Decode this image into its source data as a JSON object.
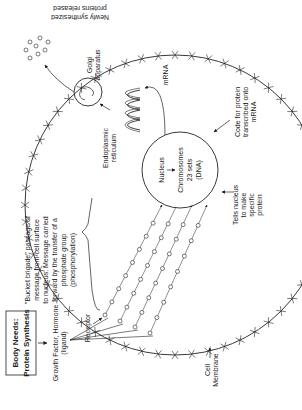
{
  "title_box": {
    "line1": "Body Needs:",
    "line2": "Protein Synthesis"
  },
  "labels": {
    "growth_factor_1": "Growth Factor, Hormone",
    "growth_factor_2": "(ligand)",
    "receptor": "Receptor",
    "cell_membrane_1": "Cell",
    "cell_membrane_2": "Membrane",
    "bucket_1": "\"Bucket brigade\" passage of",
    "bucket_2": "message from cell surface",
    "bucket_3": "to nucleus. Message carried",
    "bucket_4": "forward by the transfer of a",
    "bucket_5": "phosphate group",
    "bucket_6": "(phosphorylation)",
    "tells_1": "Tells nucleus",
    "tells_2": "to make",
    "tells_3": "specific",
    "tells_4": "protein",
    "nucleus": "Nucleus",
    "chromosomes_1": "Chromosomes",
    "chromosomes_2": "23 sets",
    "chromosomes_3": "(DNA)",
    "er_1": "Endoplasmic",
    "er_2": "reticulum",
    "mrna": "mRNA",
    "golgi_1": "Golgi",
    "golgi_2": "apparatus",
    "code_1": "Code for protein",
    "code_2": "transcribed onto",
    "code_3": "mRNA",
    "released_1": "Newly synthesized",
    "released_2": "proteins released"
  },
  "colors": {
    "ink": "#222222",
    "background": "#ffffff"
  }
}
